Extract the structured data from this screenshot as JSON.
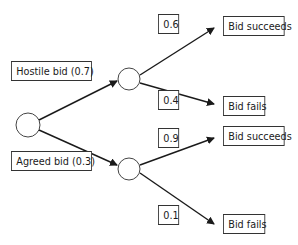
{
  "diagram": {
    "type": "decision-tree",
    "root": {
      "label": ""
    },
    "branches": [
      {
        "label": "Hostile bid (0.7)",
        "outcomes": [
          {
            "probability": "0.6",
            "label": "Bid succeeds"
          },
          {
            "probability": "0.4",
            "label": "Bid fails"
          }
        ]
      },
      {
        "label": "Agreed bid (0.3)",
        "outcomes": [
          {
            "probability": "0.9",
            "label": "Bid succeeds"
          },
          {
            "probability": "0.1",
            "label": "Bid fails"
          }
        ]
      }
    ],
    "colors": {
      "line": "#1a1a1a",
      "box_border": "#333333",
      "background": "#ffffff"
    }
  }
}
